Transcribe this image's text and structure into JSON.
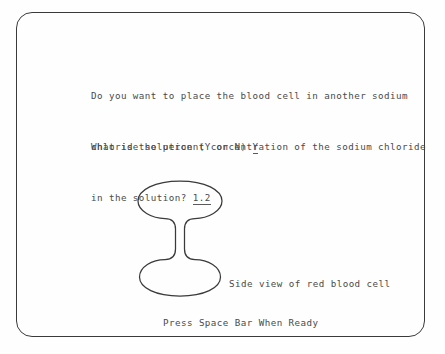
{
  "screen": {
    "border_color": "#3a3a3a",
    "background_color": "#fefefe",
    "text_color": "#4a4a4a"
  },
  "question_one": {
    "line_1": "Do you want to place the blood cell in another sodium",
    "line_2_prefix": "chloride solution (Y or N) ",
    "answer": "Y"
  },
  "question_two": {
    "line_1": "What is the percent concentration of the sodium chloride",
    "line_2_prefix": "in the solution? ",
    "answer": "1.2"
  },
  "diagram": {
    "caption": "Side view of red blood cell",
    "shape_name": "biconcave-red-blood-cell-outline",
    "stroke_color": "#3a3a3a"
  },
  "prompt": {
    "text": "Press Space Bar When Ready"
  }
}
